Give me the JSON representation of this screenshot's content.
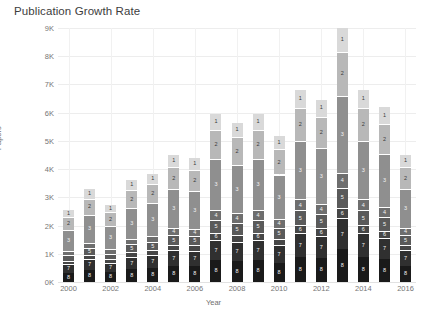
{
  "chart_data": {
    "type": "bar",
    "subtype": "stacked-bar",
    "title": "Publication Growth Rate",
    "xlabel": "Year",
    "ylabel": "Papers",
    "grid": true,
    "legend": "none",
    "ylim": [
      0,
      9000
    ],
    "yticks": [
      0,
      1000,
      2000,
      3000,
      4000,
      5000,
      6000,
      7000,
      8000,
      9000
    ],
    "ytick_labels": [
      "0K",
      "1K",
      "2K",
      "3K",
      "4K",
      "5K",
      "6K",
      "7K",
      "8K",
      "9K"
    ],
    "xtick_labels": [
      "2000",
      "2002",
      "2004",
      "2006",
      "2008",
      "2010",
      "2012",
      "2014",
      "2016"
    ],
    "categories": [
      "2000",
      "2001",
      "2002",
      "2003",
      "2004",
      "2005",
      "2006",
      "2007",
      "2008",
      "2009",
      "2010",
      "2011",
      "2012",
      "2013",
      "2014",
      "2015",
      "2016"
    ],
    "series": [
      {
        "name": "1",
        "label": "1",
        "color": "#d9d9d9",
        "text_color": "dark",
        "values": [
          250,
          330,
          270,
          350,
          360,
          420,
          410,
          560,
          520,
          560,
          480,
          640,
          600,
          840,
          640,
          580,
          420
        ]
      },
      {
        "name": "2",
        "label": "2",
        "color": "#b8b8b8",
        "text_color": "dark",
        "values": [
          440,
          560,
          470,
          620,
          660,
          780,
          760,
          1030,
          980,
          1030,
          900,
          1180,
          1120,
          1560,
          1180,
          1070,
          780
        ]
      },
      {
        "name": "3",
        "label": "3",
        "color": "#8f8f8f",
        "text_color": "light",
        "values": [
          760,
          990,
          830,
          1100,
          1170,
          1370,
          1330,
          1810,
          1720,
          1810,
          1580,
          2070,
          1970,
          2740,
          2070,
          1880,
          1370
        ]
      },
      {
        "name": "4",
        "label": "4",
        "color": "#6e6e6e",
        "text_color": "light",
        "values": [
          150,
          190,
          160,
          210,
          220,
          260,
          250,
          340,
          330,
          340,
          300,
          390,
          370,
          520,
          390,
          360,
          260
        ]
      },
      {
        "name": "5",
        "label": "5",
        "color": "#5a5a5a",
        "text_color": "light",
        "values": [
          200,
          250,
          210,
          280,
          300,
          350,
          340,
          460,
          440,
          460,
          400,
          530,
          500,
          700,
          530,
          480,
          350
        ]
      },
      {
        "name": "6",
        "label": "6",
        "color": "#474747",
        "text_color": "light",
        "values": [
          110,
          140,
          120,
          150,
          160,
          190,
          190,
          250,
          240,
          250,
          220,
          290,
          270,
          380,
          290,
          260,
          190
        ]
      },
      {
        "name": "7",
        "label": "7",
        "color": "#303030",
        "text_color": "light",
        "values": [
          310,
          400,
          330,
          440,
          470,
          550,
          540,
          730,
          690,
          730,
          640,
          840,
          790,
          1100,
          840,
          760,
          550
        ]
      },
      {
        "name": "8",
        "label": "8",
        "color": "#1a1a1a",
        "text_color": "light",
        "values": [
          330,
          420,
          350,
          460,
          490,
          580,
          570,
          770,
          730,
          770,
          670,
          880,
          840,
          1160,
          880,
          800,
          580
        ]
      }
    ],
    "totals": [
      2550,
      3280,
      2740,
      3610,
      3830,
      4500,
      4390,
      5950,
      5650,
      5950,
      5190,
      6820,
      6460,
      9000,
      6820,
      6190,
      4500
    ]
  }
}
